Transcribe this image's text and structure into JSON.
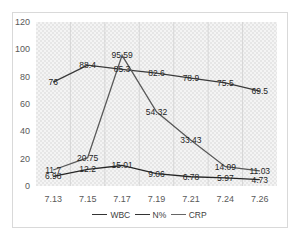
{
  "chart_data": {
    "type": "line",
    "title": "",
    "xlabel": "",
    "ylabel": "",
    "categories": [
      "7.13",
      "7.15",
      "7.17",
      "7.19",
      "7.21",
      "7.24",
      "7.26"
    ],
    "ylim": [
      0,
      120
    ],
    "yticks": [
      0,
      20,
      40,
      60,
      80,
      100,
      120
    ],
    "grid": "vertical",
    "legend_position": "bottom",
    "series": [
      {
        "name": "WBC",
        "values": [
          6.98,
          12.2,
          15.01,
          9.06,
          6.78,
          5.97,
          4.73
        ],
        "color": "#262626"
      },
      {
        "name": "N%",
        "values": [
          76,
          88.4,
          85.3,
          82.6,
          78.9,
          75.5,
          69.5
        ],
        "color": "#3a3a3a"
      },
      {
        "name": "CRP",
        "values": [
          11.7,
          20.75,
          95.59,
          54.32,
          33.43,
          14.09,
          11.03
        ],
        "color": "#595959"
      }
    ]
  },
  "legend": {
    "items": [
      "WBC",
      "N%",
      "CRP"
    ]
  }
}
